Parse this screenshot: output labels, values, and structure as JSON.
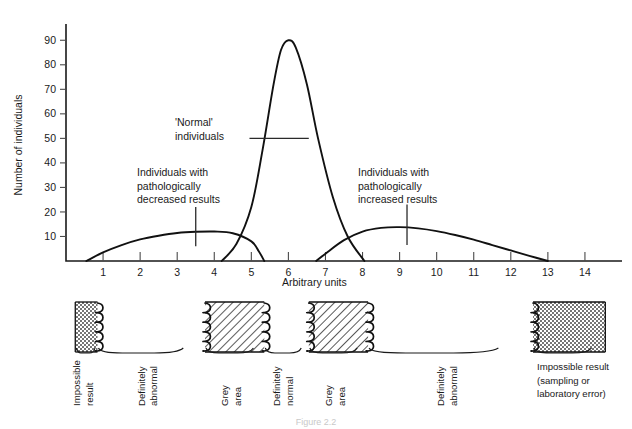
{
  "figure": {
    "caption": "Figure 2.2"
  },
  "chart_data": {
    "type": "line",
    "title": "",
    "xlabel": "Arbitrary units",
    "ylabel": "Number of individuals",
    "xlim": [
      0,
      15
    ],
    "ylim": [
      0,
      95
    ],
    "grid": false,
    "legend": "none",
    "xticks": [
      "1",
      "2",
      "3",
      "4",
      "5",
      "6",
      "7",
      "8",
      "9",
      "10",
      "11",
      "12",
      "13",
      "14"
    ],
    "xtick_values": [
      1,
      2,
      3,
      4,
      5,
      6,
      7,
      8,
      9,
      10,
      11,
      12,
      13,
      14
    ],
    "yticks": [
      "10",
      "20",
      "30",
      "40",
      "50",
      "60",
      "70",
      "80",
      "90"
    ],
    "ytick_values": [
      10,
      20,
      30,
      40,
      50,
      60,
      70,
      80,
      90
    ],
    "series": [
      {
        "name": "Individuals with pathologically decreased results",
        "x": [
          0.55,
          1.0,
          1.5,
          2.0,
          2.5,
          3.0,
          3.5,
          4.0,
          4.5,
          5.0,
          5.2,
          5.35
        ],
        "y": [
          0,
          3.5,
          6.5,
          8.8,
          10.3,
          11.4,
          11.9,
          12.0,
          11.3,
          8.0,
          4.0,
          0
        ]
      },
      {
        "name": "'Normal' individuals",
        "x": [
          4.2,
          4.6,
          5.0,
          5.3,
          5.6,
          5.8,
          6.0,
          6.2,
          6.5,
          6.8,
          7.2,
          7.6,
          8.05
        ],
        "y": [
          0,
          7,
          22,
          45,
          72,
          86,
          90,
          87,
          72,
          50,
          26,
          10,
          0
        ]
      },
      {
        "name": "Individuals with pathologically increased results",
        "x": [
          6.75,
          7.0,
          7.5,
          8.0,
          8.5,
          9.0,
          9.5,
          10.0,
          10.5,
          11.0,
          11.5,
          12.0,
          12.5,
          13.0
        ],
        "y": [
          0,
          3.0,
          8.5,
          12.0,
          13.5,
          13.8,
          13.3,
          12.2,
          10.6,
          8.7,
          6.5,
          4.3,
          2.1,
          0
        ]
      }
    ],
    "annotations": [
      {
        "name": "normal-individuals",
        "lines": [
          "'Normal'",
          "individuals"
        ],
        "leader": "horizontal",
        "leader_y_value": 50,
        "leader_x_from": 4.95,
        "leader_x_to": 6.55
      },
      {
        "name": "decreased-results",
        "lines": [
          "Individuals with",
          "pathologically",
          "decreased results"
        ],
        "leader": "vertical",
        "leader_x_value": 3.5,
        "leader_y_from": 6.0,
        "leader_y_to": 22.0
      },
      {
        "name": "increased-results",
        "lines": [
          "Individuals with",
          "pathologically",
          "increased results"
        ],
        "leader": "vertical",
        "leader_x_value": 9.2,
        "leader_y_from": 6.5,
        "leader_y_to": 23.0
      }
    ]
  },
  "band": {
    "segments": [
      {
        "name": "impossible-result",
        "label": [
          "Impossible",
          "result"
        ],
        "orientation": "vertical",
        "fill": "dots",
        "x_from": 0.25,
        "x_to": 0.85
      },
      {
        "name": "definitely-abnormal-low",
        "label": [
          "Definitely",
          "abnormal"
        ],
        "orientation": "vertical",
        "fill": "none",
        "x_from": 0.85,
        "x_to": 3.75
      },
      {
        "name": "grey-area-low",
        "label": [
          "Grey",
          "area"
        ],
        "orientation": "vertical",
        "fill": "hatch",
        "x_from": 3.75,
        "x_to": 5.35
      },
      {
        "name": "definitely-normal",
        "label": [
          "Definitely",
          "normal"
        ],
        "orientation": "vertical",
        "fill": "none",
        "x_from": 5.35,
        "x_to": 6.55
      },
      {
        "name": "grey-area-high",
        "label": [
          "Grey",
          "area"
        ],
        "orientation": "vertical",
        "fill": "hatch",
        "x_from": 6.55,
        "x_to": 8.15
      },
      {
        "name": "definitely-abnormal-high",
        "label": [
          "Definitely",
          "abnormal"
        ],
        "orientation": "vertical",
        "fill": "none",
        "x_from": 8.15,
        "x_to": 12.6
      },
      {
        "name": "impossible-result-high",
        "label": [
          "Impossible result",
          "(sampling or",
          "laboratory error)"
        ],
        "orientation": "horizontal",
        "fill": "dots",
        "x_from": 12.6,
        "x_to": 14.55
      }
    ]
  }
}
